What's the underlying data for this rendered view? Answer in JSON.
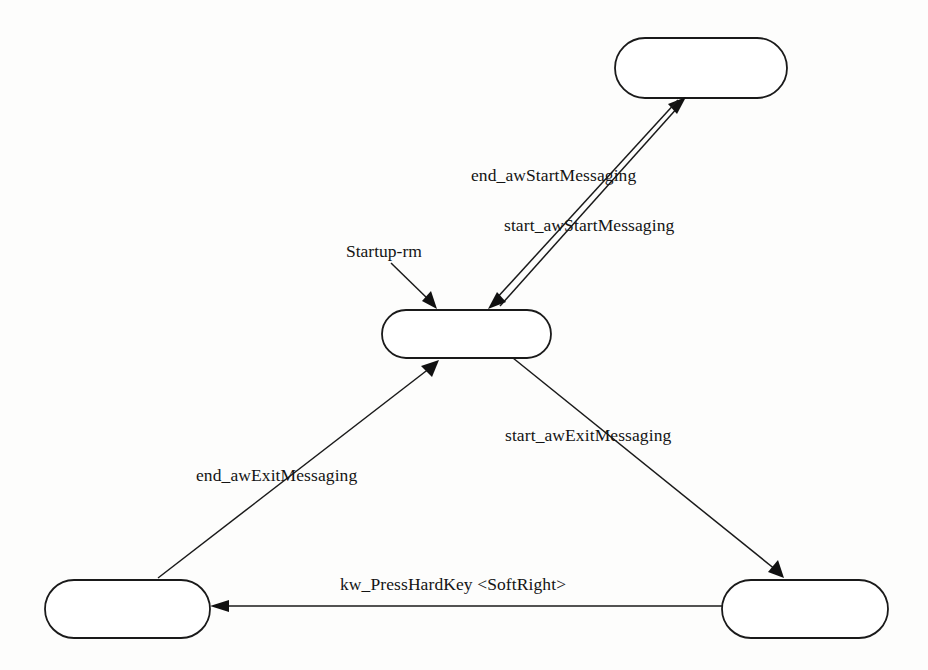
{
  "diagram": {
    "type": "state-transition-diagram",
    "background_color": "#fdfdfc",
    "stroke_color": "#1a1a1a",
    "nodes": [
      {
        "id": "node-top",
        "label": "",
        "x": 615,
        "y": 38,
        "w": 172,
        "h": 60
      },
      {
        "id": "node-middle",
        "label": "",
        "x": 382,
        "y": 310,
        "w": 169,
        "h": 48
      },
      {
        "id": "node-bottom-left",
        "label": "",
        "x": 45,
        "y": 580,
        "w": 165,
        "h": 58
      },
      {
        "id": "node-bottom-right",
        "label": "",
        "x": 722,
        "y": 580,
        "w": 166,
        "h": 58
      }
    ],
    "edges": [
      {
        "id": "edge-end-aw-start-messaging",
        "label": "end_awStartMessaging",
        "from": "node-top",
        "to": "node-middle",
        "label_x": 471,
        "label_y": 165
      },
      {
        "id": "edge-start-aw-start-messaging",
        "label": "start_awStartMessaging",
        "from": "node-middle",
        "to": "node-top",
        "label_x": 504,
        "label_y": 215
      },
      {
        "id": "edge-start-aw-exit-messaging",
        "label": "start_awExitMessaging",
        "from": "node-middle",
        "to": "node-bottom-right",
        "label_x": 505,
        "label_y": 425
      },
      {
        "id": "edge-end-aw-exit-messaging",
        "label": "end_awExitMessaging",
        "from": "node-bottom-left",
        "to": "node-middle",
        "label_x": 196,
        "label_y": 465
      },
      {
        "id": "edge-kw-press-hard-key",
        "label": "kw_PressHardKey <SoftRight>",
        "from": "node-bottom-right",
        "to": "node-bottom-left",
        "label_x": 340,
        "label_y": 574
      }
    ],
    "annotations": [
      {
        "id": "annotation-startup-rm",
        "label": "Startup-rm",
        "points_to": "node-middle",
        "label_x": 346,
        "label_y": 241
      }
    ]
  }
}
